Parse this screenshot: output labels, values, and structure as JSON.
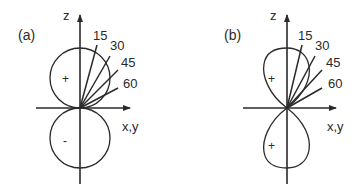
{
  "panels": [
    {
      "label": "(a)",
      "axis_z": "z",
      "axis_xy": "x,y",
      "upper_lobe_sign": "+",
      "lower_lobe_sign": "-",
      "angles": [
        "15",
        "30",
        "45",
        "60"
      ],
      "lobe_shape": "circle"
    },
    {
      "label": "(b)",
      "axis_z": "z",
      "axis_xy": "x,y",
      "upper_lobe_sign": "+",
      "lower_lobe_sign": "+",
      "angles": [
        "15",
        "30",
        "45",
        "60"
      ],
      "lobe_shape": "elongated"
    }
  ],
  "colors": {
    "stroke": "#2a2a2a",
    "background": "#ffffff"
  }
}
